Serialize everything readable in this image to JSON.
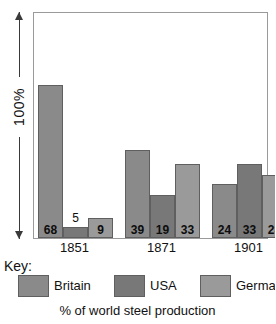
{
  "chart_data": {
    "type": "bar",
    "title": "",
    "caption": "% of world steel production",
    "xlabel": "",
    "ylabel": "100%",
    "ylim": [
      0,
      100
    ],
    "grid": false,
    "legend_position": "bottom",
    "categories": [
      "1851",
      "1871",
      "1901"
    ],
    "series": [
      {
        "name": "Britain",
        "color": "#8a8a8a",
        "values": [
          68,
          39,
          24
        ]
      },
      {
        "name": "USA",
        "color": "#787878",
        "values": [
          5,
          19,
          33
        ]
      },
      {
        "name": "Germany",
        "color": "#9a9a9a",
        "values": [
          9,
          33,
          28
        ]
      }
    ],
    "bars": [
      {
        "group": "1851",
        "series": "Britain",
        "value": 68,
        "label": "68",
        "label_inside": true
      },
      {
        "group": "1851",
        "series": "USA",
        "value": 5,
        "label": "5",
        "label_inside": false
      },
      {
        "group": "1851",
        "series": "Germany",
        "value": 9,
        "label": "9",
        "label_inside": true
      },
      {
        "group": "1871",
        "series": "Britain",
        "value": 39,
        "label": "39",
        "label_inside": true
      },
      {
        "group": "1871",
        "series": "USA",
        "value": 19,
        "label": "19",
        "label_inside": true
      },
      {
        "group": "1871",
        "series": "Germany",
        "value": 33,
        "label": "33",
        "label_inside": true
      },
      {
        "group": "1901",
        "series": "Britain",
        "value": 24,
        "label": "24",
        "label_inside": true
      },
      {
        "group": "1901",
        "series": "USA",
        "value": 33,
        "label": "33",
        "label_inside": true
      },
      {
        "group": "1901",
        "series": "Germany",
        "value": 28,
        "label": "28",
        "label_inside": true
      }
    ]
  },
  "axis": {
    "y_label": "100%"
  },
  "key": {
    "title": "Key:"
  },
  "legend": {
    "items": [
      {
        "label": "Britain",
        "color": "#8a8a8a"
      },
      {
        "label": "USA",
        "color": "#787878"
      },
      {
        "label": "Germany",
        "color": "#9a9a9a"
      }
    ]
  },
  "caption": {
    "text": "% of world steel production"
  },
  "years": [
    {
      "label": "1851"
    },
    {
      "label": "1871"
    },
    {
      "label": "1901"
    }
  ]
}
